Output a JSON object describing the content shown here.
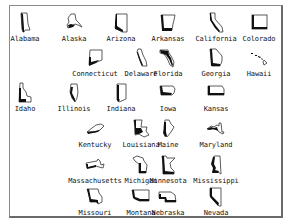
{
  "window": {
    "type": "icon-view",
    "icons": [
      {
        "label": "Alabama",
        "icon": "alabama-state-icon"
      },
      {
        "label": "Alaska",
        "icon": "alaska-state-icon"
      },
      {
        "label": "Arizona",
        "icon": "arizona-state-icon"
      },
      {
        "label": "Arkansas",
        "icon": "arkansas-state-icon"
      },
      {
        "label": "California",
        "icon": "california-state-icon"
      },
      {
        "label": "Colorado",
        "icon": "colorado-state-icon"
      },
      {
        "label": "Connecticut",
        "icon": "connecticut-state-icon"
      },
      {
        "label": "Delaware",
        "icon": "delaware-state-icon"
      },
      {
        "label": "Florida",
        "icon": "florida-state-icon"
      },
      {
        "label": "Georgia",
        "icon": "georgia-state-icon"
      },
      {
        "label": "Hawaii",
        "icon": "hawaii-state-icon"
      },
      {
        "label": "Idaho",
        "icon": "idaho-state-icon"
      },
      {
        "label": "Illinois",
        "icon": "illinois-state-icon"
      },
      {
        "label": "Indiana",
        "icon": "indiana-state-icon"
      },
      {
        "label": "Iowa",
        "icon": "iowa-state-icon"
      },
      {
        "label": "Kansas",
        "icon": "kansas-state-icon"
      },
      {
        "label": "Kentucky",
        "icon": "kentucky-state-icon"
      },
      {
        "label": "Louisiana",
        "icon": "louisiana-state-icon"
      },
      {
        "label": "Maine",
        "icon": "maine-state-icon"
      },
      {
        "label": "Maryland",
        "icon": "maryland-state-icon"
      },
      {
        "label": "Massachusetts",
        "icon": "massachusetts-state-icon"
      },
      {
        "label": "Michigan",
        "icon": "michigan-state-icon"
      },
      {
        "label": "Minnesota",
        "icon": "minnesota-state-icon"
      },
      {
        "label": "Mississippi",
        "icon": "mississippi-state-icon"
      },
      {
        "label": "Missouri",
        "icon": "missouri-state-icon"
      },
      {
        "label": "Montana",
        "icon": "montana-state-icon"
      },
      {
        "label": "Nebraska",
        "icon": "nebraska-state-icon"
      },
      {
        "label": "Nevada",
        "icon": "nevada-state-icon"
      }
    ]
  }
}
